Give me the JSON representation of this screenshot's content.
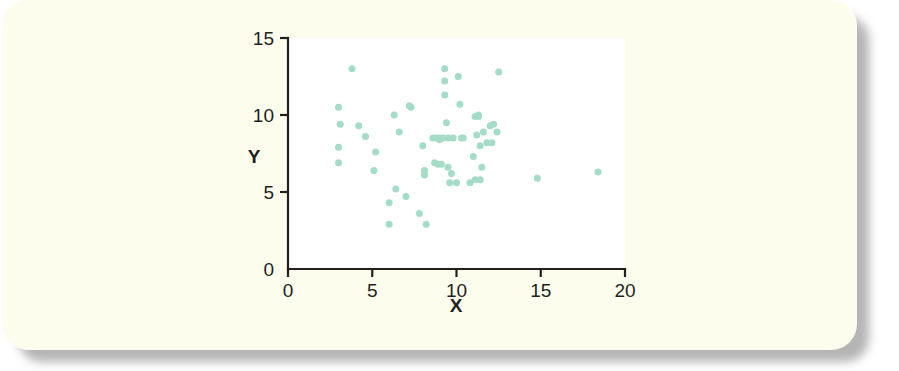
{
  "figure": {
    "card_background": "#fdfdee",
    "page_background": "#ffffff",
    "plot_background": "#ffffff",
    "axis_color": "#231f20",
    "point_color": "#a5dcc8"
  },
  "chart_data": {
    "type": "scatter",
    "title": "",
    "xlabel": "X",
    "ylabel": "Y",
    "xlim": [
      0,
      20
    ],
    "ylim": [
      0,
      15
    ],
    "xticks": [
      0,
      5,
      10,
      15,
      20
    ],
    "yticks": [
      0,
      5,
      10,
      15
    ],
    "xtick_labels": [
      "0",
      "5",
      "10",
      "15",
      "20"
    ],
    "ytick_labels": [
      "0",
      "5",
      "10",
      "15"
    ],
    "grid": false,
    "legend": null,
    "marker": "circle",
    "marker_size": 7,
    "n_points": 63,
    "points": [
      [
        3.0,
        10.5
      ],
      [
        3.1,
        9.4
      ],
      [
        3.0,
        7.9
      ],
      [
        3.0,
        6.9
      ],
      [
        3.8,
        13.0
      ],
      [
        4.6,
        8.6
      ],
      [
        5.2,
        7.6
      ],
      [
        5.1,
        6.4
      ],
      [
        6.0,
        4.3
      ],
      [
        6.0,
        2.9
      ],
      [
        6.3,
        10.0
      ],
      [
        6.4,
        5.2
      ],
      [
        6.6,
        8.9
      ],
      [
        7.0,
        4.7
      ],
      [
        7.2,
        10.6
      ],
      [
        7.3,
        10.5
      ],
      [
        7.8,
        3.6
      ],
      [
        8.0,
        8.0
      ],
      [
        8.1,
        6.4
      ],
      [
        8.1,
        6.1
      ],
      [
        8.2,
        2.9
      ],
      [
        8.6,
        8.5
      ],
      [
        8.7,
        6.9
      ],
      [
        8.8,
        8.5
      ],
      [
        8.9,
        6.8
      ],
      [
        9.0,
        8.5
      ],
      [
        9.1,
        6.8
      ],
      [
        9.2,
        8.5
      ],
      [
        9.3,
        11.3
      ],
      [
        9.3,
        12.2
      ],
      [
        9.3,
        13.0
      ],
      [
        9.4,
        9.5
      ],
      [
        9.5,
        6.6
      ],
      [
        9.5,
        8.5
      ],
      [
        9.7,
        6.2
      ],
      [
        9.8,
        8.5
      ],
      [
        10.0,
        5.6
      ],
      [
        10.1,
        12.5
      ],
      [
        10.2,
        10.7
      ],
      [
        10.3,
        8.5
      ],
      [
        10.8,
        5.6
      ],
      [
        11.0,
        7.3
      ],
      [
        11.1,
        5.8
      ],
      [
        11.2,
        8.7
      ],
      [
        11.3,
        9.9
      ],
      [
        11.3,
        10.0
      ],
      [
        11.4,
        5.8
      ],
      [
        11.4,
        8.0
      ],
      [
        11.5,
        6.6
      ],
      [
        11.6,
        8.9
      ],
      [
        11.8,
        8.2
      ],
      [
        12.0,
        9.3
      ],
      [
        12.1,
        8.2
      ],
      [
        12.2,
        9.4
      ],
      [
        12.4,
        8.9
      ],
      [
        12.5,
        12.8
      ],
      [
        14.8,
        5.9
      ],
      [
        18.4,
        6.3
      ],
      [
        4.2,
        9.3
      ],
      [
        9.0,
        8.4
      ],
      [
        11.1,
        9.9
      ],
      [
        10.4,
        8.5
      ],
      [
        9.6,
        5.6
      ]
    ]
  }
}
